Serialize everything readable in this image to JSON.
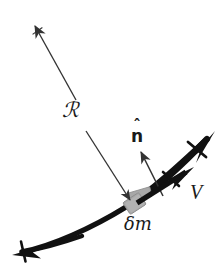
{
  "figure": {
    "background_color": "#ffffff",
    "width": 224,
    "height": 268,
    "labels": {
      "position_vector": "ℛ",
      "unit_normal_letter": "n",
      "unit_normal_hat": "ˆ",
      "velocity": "V",
      "mass_element": "δm"
    },
    "colors": {
      "curve": "#111111",
      "mass_element": "#a8a8a8",
      "mass_element_stroke": "#8f8f8f",
      "thin_arrow": "#333333",
      "text": "#1a1a1a"
    },
    "elements": {
      "string_curve_name": "string-curve",
      "position_arrow_name": "position-vector-arrow",
      "normal_arrow_name": "unit-normal-arrow",
      "velocity_arrow_name": "velocity-arrow",
      "mass_block_name": "mass-element-block"
    }
  }
}
